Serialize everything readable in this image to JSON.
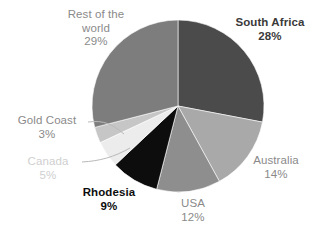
{
  "chart_data": {
    "type": "pie",
    "title": "",
    "subtitle": "",
    "xlabel": "",
    "ylabel": "",
    "legend_position": "none",
    "grid": false,
    "labels_on_slices": false,
    "label_format": "name + percent",
    "start_angle_deg": 0,
    "direction": "clockwise",
    "categories": [
      "South Africa",
      "Australia",
      "USA",
      "Rhodesia",
      "Canada",
      "Gold Coast",
      "Rest of the world"
    ],
    "values": [
      28,
      14,
      12,
      9,
      5,
      3,
      29
    ],
    "units": "percent",
    "total": 100,
    "slices": [
      {
        "name": "South Africa",
        "label_line1": "South Africa",
        "label_line2": "",
        "percent_text": "28%",
        "value": 28,
        "color": "#4b4b4b",
        "text_color": "#3a3a3a",
        "emphasis": "bold",
        "start_deg": 0,
        "end_deg": 100.8,
        "leader_line": false
      },
      {
        "name": "Australia",
        "label_line1": "Australia",
        "label_line2": "",
        "percent_text": "14%",
        "value": 14,
        "color": "#a9a9a9",
        "text_color": "#8a8a8a",
        "emphasis": "normal",
        "start_deg": 100.8,
        "end_deg": 151.2,
        "leader_line": false
      },
      {
        "name": "USA",
        "label_line1": "USA",
        "label_line2": "",
        "percent_text": "12%",
        "value": 12,
        "color": "#8e8e8e",
        "text_color": "#8a8a8a",
        "emphasis": "normal",
        "start_deg": 151.2,
        "end_deg": 194.4,
        "leader_line": false
      },
      {
        "name": "Rhodesia",
        "label_line1": "Rhodesia",
        "label_line2": "",
        "percent_text": "9%",
        "value": 9,
        "color": "#0d0d0d",
        "text_color": "#0d0d0d",
        "emphasis": "bold",
        "start_deg": 194.4,
        "end_deg": 226.8,
        "leader_line": false
      },
      {
        "name": "Canada",
        "label_line1": "Canada",
        "label_line2": "",
        "percent_text": "5%",
        "value": 5,
        "color": "#ececec",
        "text_color": "#cfcfcf",
        "emphasis": "faint",
        "start_deg": 226.8,
        "end_deg": 244.8,
        "leader_line": true
      },
      {
        "name": "Gold Coast",
        "label_line1": "Gold Coast",
        "label_line2": "",
        "percent_text": "3%",
        "value": 3,
        "color": "#c6c6c6",
        "text_color": "#8a8a8a",
        "emphasis": "normal",
        "start_deg": 244.8,
        "end_deg": 255.6,
        "leader_line": true
      },
      {
        "name": "Rest of the world",
        "label_line1": "Rest of the",
        "label_line2": "world",
        "percent_text": "29%",
        "value": 29,
        "color": "#7d7d7d",
        "text_color": "#8a8a8a",
        "emphasis": "normal",
        "start_deg": 255.6,
        "end_deg": 360,
        "leader_line": false
      }
    ],
    "geometry": {
      "center_x": 178,
      "center_y": 106,
      "radius": 86
    },
    "colors": {
      "background": "#ffffff",
      "leader_line": "#b9b9b9",
      "outline": "#9a9a9a"
    }
  }
}
